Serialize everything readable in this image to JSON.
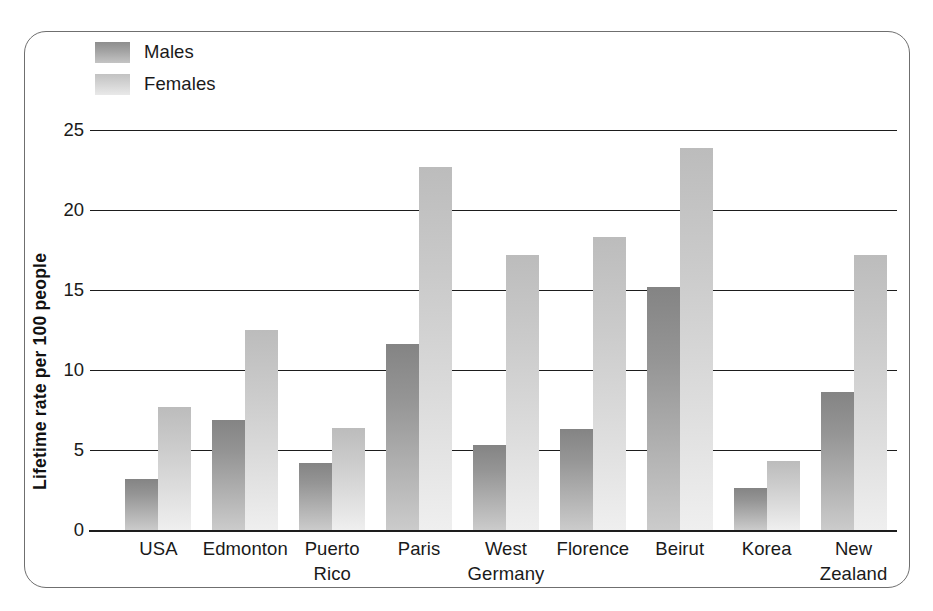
{
  "chart_data": {
    "type": "bar",
    "title": "",
    "xlabel": "",
    "ylabel": "Lifetime rate per 100 people",
    "ylim": [
      0,
      25
    ],
    "yticks": [
      0,
      5,
      10,
      15,
      20,
      25
    ],
    "ytick_labels": [
      "0",
      "5",
      "10",
      "15",
      "20",
      "25"
    ],
    "grid": true,
    "legend_position": "top-left",
    "categories": [
      "USA",
      "Edmonton",
      "Puerto Rico",
      "Paris",
      "West Germany",
      "Florence",
      "Beirut",
      "Korea",
      "New Zealand"
    ],
    "category_lines": [
      [
        "USA"
      ],
      [
        "Edmonton"
      ],
      [
        "Puerto",
        "Rico"
      ],
      [
        "Paris"
      ],
      [
        "West",
        "Germany"
      ],
      [
        "Florence"
      ],
      [
        "Beirut"
      ],
      [
        "Korea"
      ],
      [
        "New",
        "Zealand"
      ]
    ],
    "series": [
      {
        "name": "Males",
        "color": "#959595",
        "values": [
          3.2,
          6.9,
          4.2,
          11.6,
          5.3,
          6.3,
          15.2,
          2.6,
          8.6
        ]
      },
      {
        "name": "Females",
        "color": "#d0d0d0",
        "values": [
          7.7,
          12.5,
          6.4,
          22.7,
          17.2,
          18.3,
          23.9,
          4.3,
          17.2
        ]
      }
    ]
  },
  "legend": {
    "items": [
      {
        "label": "Males",
        "swatch": "males"
      },
      {
        "label": "Females",
        "swatch": "females"
      }
    ]
  },
  "axis": {
    "y_title": "Lifetime rate per 100 people"
  }
}
